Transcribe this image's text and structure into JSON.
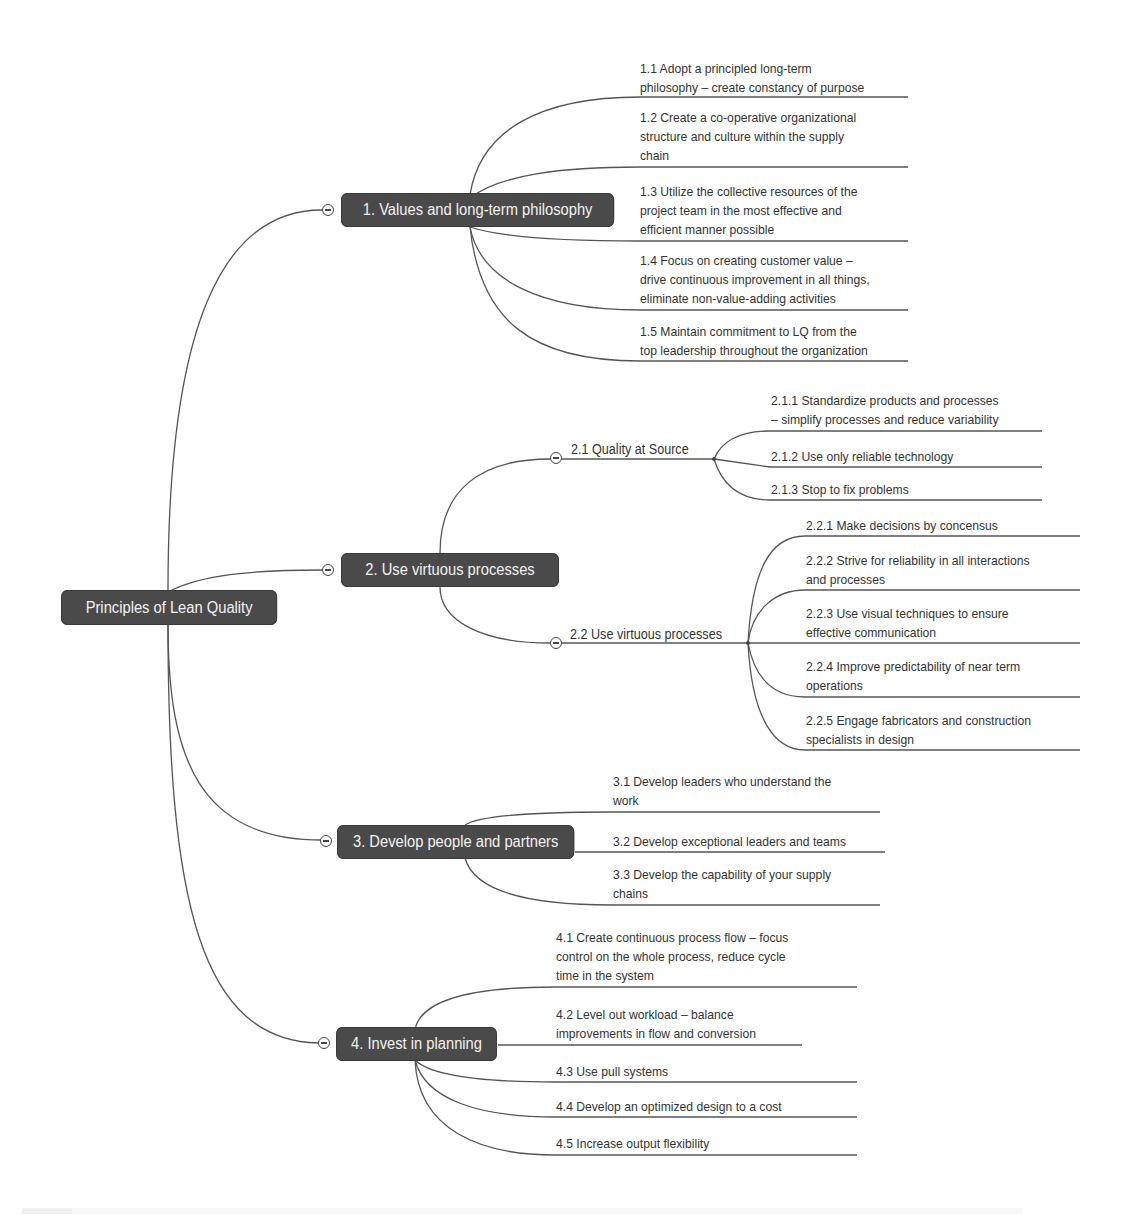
{
  "root": {
    "label": "Principles of Lean Quality"
  },
  "branches": [
    {
      "label": "1. Values and long-term philosophy",
      "children": [
        "1.1 Adopt a principled long-term\nphilosophy – create constancy of purpose",
        "1.2 Create a co-operative organizational\nstructure and culture within the supply\nchain",
        "1.3 Utilize the collective resources of the\nproject team in the most effective and\nefficient manner possible",
        "1.4 Focus on creating customer value –\ndrive continuous improvement in all things,\neliminate non-value-adding activities",
        "1.5 Maintain commitment to LQ from the\ntop leadership throughout the organization"
      ]
    },
    {
      "label": "2. Use virtuous processes",
      "subbranches": [
        {
          "label": "2.1 Quality at Source",
          "children": [
            "2.1.1 Standardize products and processes\n– simplify processes and reduce variability",
            "2.1.2 Use only reliable technology",
            "2.1.3 Stop to fix problems"
          ]
        },
        {
          "label": "2.2 Use virtuous processes",
          "children": [
            "2.2.1 Make decisions by concensus",
            "2.2.2 Strive for reliability in all interactions\nand processes",
            "2.2.3 Use visual techniques to ensure\neffective communication",
            "2.2.4 Improve predictability of near term\noperations",
            "2.2.5 Engage fabricators and construction\nspecialists in design"
          ]
        }
      ]
    },
    {
      "label": "3. Develop people and partners",
      "children": [
        "3.1 Develop leaders who understand the\nwork",
        "3.2 Develop exceptional leaders and teams",
        "3.3 Develop the capability of your supply\nchains"
      ]
    },
    {
      "label": "4. Invest in planning",
      "children": [
        "4.1 Create continuous process flow – focus\ncontrol on the whole process, reduce cycle\ntime in the system",
        "4.2 Level out workload – balance\nimprovements in flow and conversion",
        "4.3 Use pull systems",
        "4.4 Develop an optimized design to a cost",
        "4.5 Increase output flexibility"
      ]
    }
  ],
  "colors": {
    "node_bg": "#4a4a4a",
    "node_text": "#f2f2f2",
    "line": "#444444",
    "leaf_text": "#333333"
  }
}
